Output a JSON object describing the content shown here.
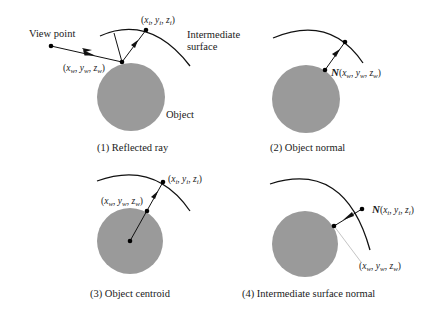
{
  "figure": {
    "panels": [
      {
        "id": 1,
        "caption": "(1) Reflected ray",
        "labels": {
          "view_point": "View point",
          "surface_point": "(x",
          "surface_coord": {
            "x": "x",
            "y": "y",
            "z": "z",
            "sub": "w"
          },
          "intermediate_coord": {
            "x": "x",
            "y": "y",
            "z": "z",
            "sub": "i"
          },
          "intermediate_surface_line1": "Intermediate",
          "intermediate_surface_line2": "surface",
          "object": "Object"
        }
      },
      {
        "id": 2,
        "caption": "(2) Object normal",
        "labels": {
          "normal_symbol": "N",
          "surface_coord": {
            "x": "x",
            "y": "y",
            "z": "z",
            "sub": "w"
          }
        }
      },
      {
        "id": 3,
        "caption": "(3) Object centroid",
        "labels": {
          "surface_coord": {
            "x": "x",
            "y": "y",
            "z": "z",
            "sub": "w"
          },
          "intermediate_coord": {
            "x": "x",
            "y": "y",
            "z": "z",
            "sub": "i"
          }
        }
      },
      {
        "id": 4,
        "caption": "(4) Intermediate surface normal",
        "labels": {
          "normal_symbol": "N",
          "intermediate_coord": {
            "x": "x",
            "y": "y",
            "z": "z",
            "sub": "i"
          },
          "surface_coord": {
            "x": "x",
            "y": "y",
            "z": "z",
            "sub": "w"
          }
        }
      }
    ],
    "punct": {
      "open": "(",
      "close": ")",
      "sep": ", "
    },
    "colors": {
      "object_fill": "#9a9a9a",
      "line": "#111111",
      "projection_line": "#b5b5b5"
    }
  }
}
